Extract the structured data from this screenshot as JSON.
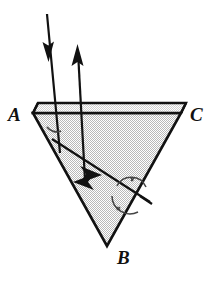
{
  "figure": {
    "background_color": "#ffffff",
    "stroke_color": "#111111",
    "prism_fill_color": "#d9d9d9",
    "prism_top_face_color": "#e8e8e8",
    "labels": {
      "vertex_a": "A",
      "vertex_b": "B",
      "vertex_c": "C"
    },
    "geometry": {
      "vertex_a_point": [
        33,
        113
      ],
      "vertex_b_point": [
        107,
        246
      ],
      "vertex_c_point": [
        181,
        113
      ],
      "top_face_back_left": [
        38,
        103
      ],
      "top_face_back_right": [
        186,
        103
      ],
      "top_face_front_left": [
        33,
        113
      ],
      "top_face_front_right": [
        181,
        113
      ]
    },
    "rays": {
      "incident": {
        "name": "incident-ray",
        "direction": "down",
        "from": [
          48,
          14
        ],
        "to": [
          60,
          152
        ],
        "arrowhead_at": [
          48,
          58
        ]
      },
      "exiting": {
        "name": "exiting-ray",
        "direction": "up",
        "from": [
          84,
          178
        ],
        "to": [
          78,
          48
        ],
        "arrowhead_at": [
          78,
          50
        ]
      },
      "internal": {
        "name": "internal-refracted-ray",
        "from": [
          55,
          141
        ],
        "to": [
          146,
          200
        ],
        "arrowheads": [
          [
            95,
            172
          ],
          [
            86,
            184
          ]
        ]
      }
    },
    "angle_marks": [
      {
        "name": "angle-arc-entry",
        "center": [
          58,
          133
        ],
        "radius": 11
      },
      {
        "name": "angle-arc-exit-upper",
        "center": [
          131,
          192
        ],
        "radius": 17,
        "tick": true
      },
      {
        "name": "angle-arc-exit-lower",
        "center": [
          128,
          199
        ],
        "radius": 18,
        "tick": true
      }
    ]
  }
}
